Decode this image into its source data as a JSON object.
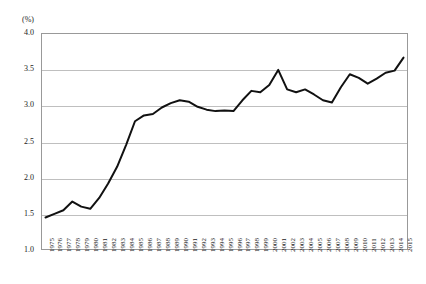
{
  "chart_data": {
    "type": "line",
    "title": "",
    "subtitle": "",
    "xlabel": "",
    "ylabel": "",
    "unit_label": "(%)",
    "ylim": [
      1.0,
      4.0
    ],
    "ytick_values": [
      4.0,
      3.5,
      3.0,
      2.5,
      2.0,
      1.5,
      1.0
    ],
    "ytick_labels": [
      "4.0",
      "3.5",
      "3.0",
      "2.5",
      "2.0",
      "1.5",
      "1.0"
    ],
    "grid": true,
    "grid_axis": "y",
    "legend": "none",
    "line_color": "#111111",
    "grid_color": "#bfbfbf",
    "frame_color": "#999999",
    "categories": [
      "1975",
      "1976",
      "1977",
      "1978",
      "1979",
      "1980",
      "1981",
      "1982",
      "1983",
      "1984",
      "1985",
      "1986",
      "1987",
      "1988",
      "1989",
      "1990",
      "1991",
      "1992",
      "1993",
      "1994",
      "1995",
      "1996",
      "1997",
      "1998",
      "1999",
      "2000",
      "2001",
      "2002",
      "2003",
      "2004",
      "2005",
      "2006",
      "2007",
      "2008",
      "2009",
      "2010",
      "2011",
      "2012",
      "2013",
      "2014",
      "2015"
    ],
    "series": [
      {
        "name": "",
        "values": [
          1.45,
          1.5,
          1.55,
          1.67,
          1.6,
          1.57,
          1.72,
          1.92,
          2.15,
          2.45,
          2.78,
          2.86,
          2.88,
          2.97,
          3.03,
          3.07,
          3.05,
          2.98,
          2.94,
          2.92,
          2.93,
          2.92,
          3.07,
          3.2,
          3.18,
          3.28,
          3.49,
          3.22,
          3.18,
          3.22,
          3.15,
          3.07,
          3.04,
          3.25,
          3.43,
          3.38,
          3.3,
          3.37,
          3.45,
          3.48,
          3.66
        ]
      }
    ]
  }
}
